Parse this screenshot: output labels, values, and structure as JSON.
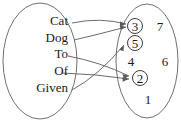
{
  "diagram": {
    "type": "mapping-diagram",
    "domain_set": {
      "name": "left-ellipse",
      "items": [
        {
          "label": "Cat",
          "x": 68,
          "y": 25
        },
        {
          "label": "Dog",
          "x": 68,
          "y": 42
        },
        {
          "label": "To",
          "x": 68,
          "y": 58
        },
        {
          "label": "Of",
          "x": 68,
          "y": 75
        },
        {
          "label": "Given",
          "x": 68,
          "y": 92
        }
      ]
    },
    "codomain_set": {
      "name": "right-ellipse",
      "items": [
        {
          "label": "3",
          "x": 135,
          "y": 26,
          "circled": true
        },
        {
          "label": "7",
          "x": 160,
          "y": 26,
          "circled": false
        },
        {
          "label": "5",
          "x": 135,
          "y": 43,
          "circled": true
        },
        {
          "label": "4",
          "x": 131,
          "y": 61,
          "circled": false
        },
        {
          "label": "6",
          "x": 165,
          "y": 61,
          "circled": false
        },
        {
          "label": "2",
          "x": 140,
          "y": 78,
          "circled": true
        },
        {
          "label": "1",
          "x": 148,
          "y": 99,
          "circled": false
        }
      ]
    },
    "arrows": [
      {
        "from": "Cat",
        "to": "3"
      },
      {
        "from": "Dog",
        "to": "3"
      },
      {
        "from": "To",
        "to": "2"
      },
      {
        "from": "Of",
        "to": "2"
      },
      {
        "from": "Given",
        "to": "5"
      }
    ],
    "colors": {
      "outline": "#6f6f6f",
      "line": "#6a6a6a",
      "text": "#1a1a1a",
      "background": "#ffffff"
    }
  }
}
